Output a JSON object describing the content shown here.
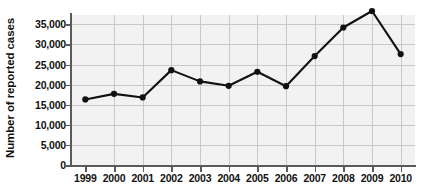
{
  "chart_data": {
    "type": "line",
    "title": "",
    "xlabel": "",
    "ylabel": "Number of reported cases",
    "categories": [
      "1999",
      "2000",
      "2001",
      "2002",
      "2003",
      "2004",
      "2005",
      "2006",
      "2007",
      "2008",
      "2009",
      "2010"
    ],
    "values": [
      16300,
      17700,
      16800,
      23600,
      20800,
      19700,
      23200,
      19600,
      27100,
      34200,
      38300,
      27600
    ],
    "series": [
      {
        "name": "Number of reported cases",
        "values": [
          16300,
          17700,
          16800,
          23600,
          20800,
          19700,
          23200,
          19600,
          27100,
          34200,
          38300,
          27600
        ]
      }
    ],
    "ylim": [
      0,
      40000
    ],
    "yticks": [
      0,
      5000,
      10000,
      15000,
      20000,
      25000,
      30000,
      35000
    ],
    "ytick_labels": [
      "0",
      "5,000",
      "10,000",
      "15,000",
      "20,000",
      "25,000",
      "30,000",
      "35,000"
    ],
    "xtick_labels": [
      "1999",
      "2000",
      "2001",
      "2002",
      "2003",
      "2004",
      "2005",
      "2006",
      "2007",
      "2008",
      "2009",
      "2010"
    ],
    "grid": true,
    "legend": "none",
    "marker": "filled-circle",
    "line_color": "#111111",
    "marker_color": "#111111",
    "plot_background": "#f2f2f2",
    "gridline_color": "#c9c9c9",
    "axis_color": "#5a5a5a"
  }
}
